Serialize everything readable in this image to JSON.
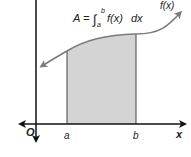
{
  "diagram": {
    "formula": {
      "lhs": "A =",
      "integral_sign": "∫",
      "upper_limit": "b",
      "lower_limit": "a",
      "integrand": "f(x)",
      "differential": "dx"
    },
    "curve_label": "f(x)",
    "origin_label": "O",
    "x_axis_label": "x",
    "bound_a_label": "a",
    "bound_b_label": "b",
    "colors": {
      "curve": "#7a7a7a",
      "shaded_area": "#d4d4d4",
      "axes": "#111111",
      "bounds": "#444444"
    }
  }
}
